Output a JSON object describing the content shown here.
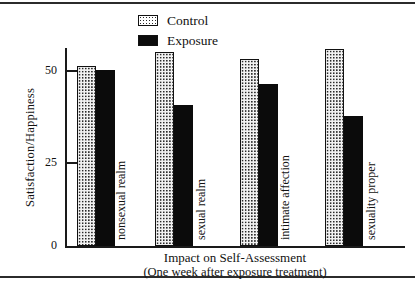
{
  "chart_data": {
    "type": "bar",
    "title": "",
    "xlabel": "Impact on Self-Assessment",
    "xlabel_sub": "(One week after exposure treatment)",
    "ylabel": "Satisfaction/Happiness",
    "categories": [
      "nonsexual realm",
      "sexual realm",
      "intimate affection",
      "sexuality proper"
    ],
    "series": [
      {
        "name": "Control",
        "values": [
          51,
          55,
          53,
          56
        ]
      },
      {
        "name": "Exposure",
        "values": [
          50,
          40,
          46,
          37
        ]
      }
    ],
    "ylim": [
      0,
      60
    ],
    "yticks": [
      0,
      25,
      50
    ],
    "ytick_labels": [
      "0",
      "25",
      "50"
    ],
    "grid": false,
    "legend_position": "top-center",
    "colors": {
      "control": "#f2f2f2",
      "control_border": "#111111",
      "exposure": "#0b0b0b",
      "axis": "#1a1a1a",
      "text": "#111111"
    }
  },
  "legend": {
    "items": [
      {
        "label": "Control",
        "swatch": "dotted-pattern-swatch"
      },
      {
        "label": "Exposure",
        "swatch": "solid-black-swatch"
      }
    ]
  }
}
